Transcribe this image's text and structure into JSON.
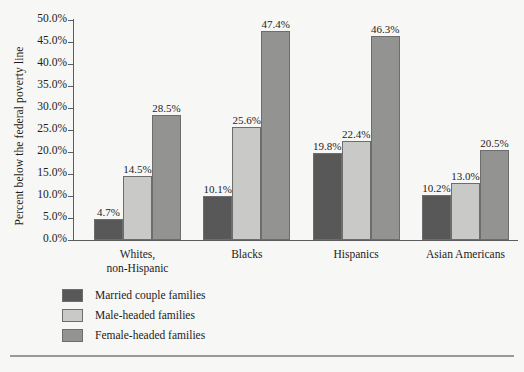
{
  "chart_data": {
    "type": "bar",
    "title": "",
    "subtitle": "",
    "xlabel": "",
    "ylabel": "Percent below the federal poverty line",
    "ylim": [
      0,
      50
    ],
    "ytick_labels": [
      "0.0%",
      "5.0%",
      "10.0%",
      "15.0%",
      "20.0%",
      "25.0%",
      "30.0%",
      "35.0%",
      "40.0%",
      "45.0%",
      "50.0%"
    ],
    "ytick_values": [
      0,
      5,
      10,
      15,
      20,
      25,
      30,
      35,
      40,
      45,
      50
    ],
    "grid": false,
    "legend_position": "below-left",
    "categories": [
      "Whites,\nnon-Hispanic",
      "Blacks",
      "Hispanics",
      "Asian Americans"
    ],
    "category_lines": [
      [
        "Whites,",
        "non-Hispanic"
      ],
      [
        "Blacks"
      ],
      [
        "Hispanics"
      ],
      [
        "Asian Americans"
      ]
    ],
    "series": [
      {
        "name": "Married couple families",
        "color": "#585858",
        "values": [
          4.7,
          10.1,
          19.8,
          10.2
        ],
        "labels": [
          "4.7%",
          "10.1%",
          "19.8%",
          "10.2%"
        ]
      },
      {
        "name": "Male-headed families",
        "color": "#c9c9c7",
        "values": [
          14.5,
          25.6,
          22.4,
          13.0
        ],
        "labels": [
          "14.5%",
          "25.6%",
          "22.4%",
          "13.0%"
        ]
      },
      {
        "name": "Female-headed families",
        "color": "#939391",
        "values": [
          28.5,
          47.4,
          46.3,
          20.5
        ],
        "labels": [
          "28.5%",
          "47.4%",
          "46.3%",
          "20.5%"
        ]
      }
    ]
  },
  "legend": {
    "items": [
      {
        "label": "Married couple families",
        "color": "#585858"
      },
      {
        "label": "Male-headed families",
        "color": "#c9c9c7"
      },
      {
        "label": "Female-headed families",
        "color": "#939391"
      }
    ]
  },
  "colors": {
    "background": "#f7f7f6",
    "axis": "#5d5d5d",
    "text": "#1c1c1c",
    "bar_edge": "#6d6d6d",
    "rule": "#9a9a9a"
  }
}
